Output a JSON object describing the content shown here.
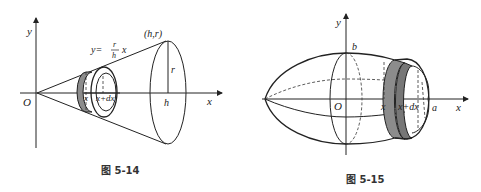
{
  "figures": [
    {
      "id": "fig-5-14",
      "caption": "图 5-14",
      "labels": {
        "y_axis": "y",
        "x_axis": "x",
        "origin": "O",
        "point": "(h,r)",
        "formula_prefix": "y=",
        "formula_num": "r",
        "formula_den": "h",
        "formula_suffix": "x",
        "radius": "r",
        "height": "h",
        "slice_x": "x",
        "slice_xdx": "x+dx"
      }
    },
    {
      "id": "fig-5-15",
      "caption": "图 5-15",
      "labels": {
        "y_axis": "y",
        "x_axis": "x",
        "origin": "O",
        "semi_minor": "b",
        "semi_major": "a",
        "slice_x": "x",
        "slice_xdx": "x+dx"
      }
    }
  ],
  "colors": {
    "shade": "#8c8c8c",
    "line": "#222222"
  }
}
